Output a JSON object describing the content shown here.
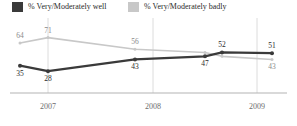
{
  "legend": {
    "items": [
      {
        "label": "% Very/Moderately well",
        "color": "#3a3a3a",
        "key": "well",
        "swatch_name": "legend-swatch-well"
      },
      {
        "label": "% Very/Moderately badly",
        "color": "#c8c8c8",
        "key": "badly",
        "swatch_name": "legend-swatch-badly"
      }
    ]
  },
  "axis": {
    "ticks": [
      {
        "label": "2007",
        "x": 48
      },
      {
        "label": "2008",
        "x": 153
      },
      {
        "label": "2009",
        "x": 257
      }
    ],
    "baseline_color": "#b4b4b4",
    "gridline_color": "#dcdcdc"
  },
  "chart_data": {
    "type": "line",
    "title": "",
    "subtitle": "",
    "xlabel": "",
    "ylabel": "",
    "grid": "vertical-only",
    "legend_position": "top-left",
    "ylim": [
      0,
      80
    ],
    "categories": [
      "2006 H2",
      "2007",
      "2007 H2",
      "2008 H2",
      "2009 H1",
      "2009 H2"
    ],
    "x_tick_labels": [
      "2007",
      "2008",
      "2009"
    ],
    "series": [
      {
        "name": "% Very/Moderately well",
        "color": "#3a3a3a",
        "values": [
          35,
          28,
          43,
          47,
          52,
          51
        ],
        "point_labels": [
          "35",
          "28",
          "43",
          "47",
          "52",
          "51"
        ],
        "label_positions": [
          "below",
          "below",
          "below",
          "below",
          "above",
          "above"
        ]
      },
      {
        "name": "% Very/Moderately badly",
        "color": "#c8c8c8",
        "values": [
          64,
          71,
          56,
          52,
          47,
          43
        ],
        "point_labels": [
          "64",
          "71",
          "56",
          "",
          "",
          "43"
        ],
        "label_positions": [
          "above",
          "above",
          "above",
          "above",
          "above",
          "below"
        ]
      }
    ]
  }
}
